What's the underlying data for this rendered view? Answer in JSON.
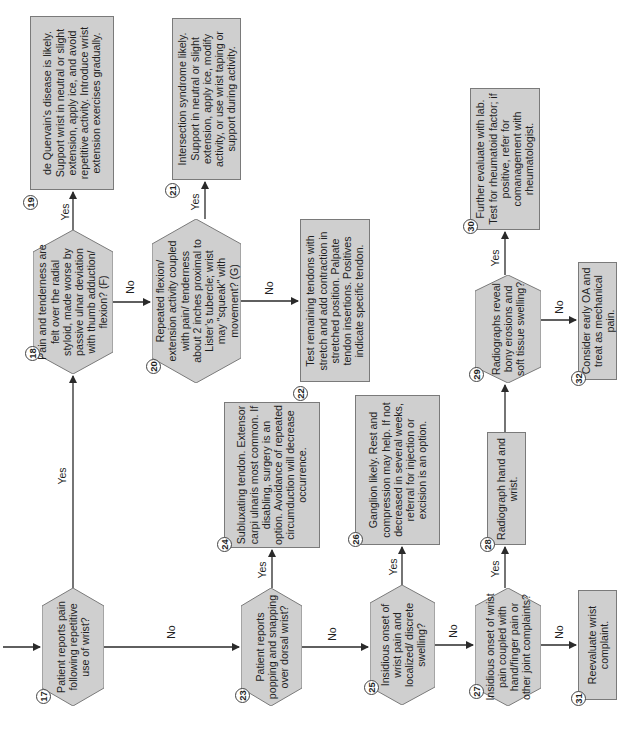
{
  "colors": {
    "fill": "#cfcfcf",
    "stroke": "#7a7a7a",
    "line": "#2a2a2a",
    "background": "#ffffff"
  },
  "nodes": {
    "n17": {
      "number": "17",
      "type": "decision",
      "text": "Patient reports pain following repetitive use of wrist?"
    },
    "n18": {
      "number": "18",
      "type": "decision",
      "text": "Pain and tenderness are felt over the radial styloid, made worse by passive ulnar deviation with thumb adduction/ flexion? (F)"
    },
    "n19": {
      "number": "19",
      "type": "action",
      "text": "de Quervain's disease is likely. Support wrist in neutral or slight extension, apply ice, and avoid repetitive activity. Introduce wrist extension exercises gradually."
    },
    "n20": {
      "number": "20",
      "type": "decision",
      "text": "Repeated flexion/ extension activity coupled with pain/ tenderness about 2 inches proximal to Lister's tubercle; wrist may \"squeak\" with movement? (G)"
    },
    "n21": {
      "number": "21",
      "type": "action",
      "text": "Intersection syndrome likely. Support in neutral or slight extension, apply ice, modify activity, or use wrist taping or support during activity."
    },
    "n22": {
      "number": "22",
      "type": "action",
      "text": "Test remaining tendons with stretch and add contraction in stretched position. Palpate tendon insertions. Positives indicate specific tendon."
    },
    "n23": {
      "number": "23",
      "type": "decision",
      "text": "Patient reports popping and snapping over dorsal wrist?"
    },
    "n24": {
      "number": "24",
      "type": "action",
      "text": "Subluxating tendon. Extensor carpi ulnaris most common. If disabling, surgery is an option. Avoidance of repeated circumduction will decrease occurrence."
    },
    "n25": {
      "number": "25",
      "type": "decision",
      "text": "Insidious onset of wrist pain and localized/ discrete swelling?"
    },
    "n26": {
      "number": "26",
      "type": "action",
      "text": "Ganglion likely. Rest and compression may help. If not decreased in several weeks, referral for injection or excision is an option."
    },
    "n27": {
      "number": "27",
      "type": "decision",
      "text": "Insidious onset of wrist pain coupled with hand/finger pain or other joint complaints?"
    },
    "n28": {
      "number": "28",
      "type": "action",
      "text": "Radiograph hand and wrist."
    },
    "n29": {
      "number": "29",
      "type": "decision",
      "text": "Radiographs reveal bony erosions and soft tissue swelling?"
    },
    "n30": {
      "number": "30",
      "type": "action",
      "text": "Further evaluate with lab. Test for rheumatoid factor; if positive, refer for comanagement with rheumatologist."
    },
    "n31": {
      "number": "31",
      "type": "action",
      "text": "Reevaluate wrist complaint."
    },
    "n32": {
      "number": "32",
      "type": "action",
      "text": "Consider early OA and treat as mechanical pain."
    }
  },
  "edges": [
    {
      "from": "entry",
      "to": "17",
      "label": ""
    },
    {
      "from": "17",
      "to": "18",
      "label": "Yes"
    },
    {
      "from": "17",
      "to": "23",
      "label": "No"
    },
    {
      "from": "18",
      "to": "19",
      "label": "Yes"
    },
    {
      "from": "18",
      "to": "20",
      "label": "No"
    },
    {
      "from": "20",
      "to": "21",
      "label": "Yes"
    },
    {
      "from": "20",
      "to": "22",
      "label": "No"
    },
    {
      "from": "23",
      "to": "24",
      "label": "Yes"
    },
    {
      "from": "23",
      "to": "25",
      "label": "No"
    },
    {
      "from": "25",
      "to": "26",
      "label": "Yes"
    },
    {
      "from": "25",
      "to": "27",
      "label": "No"
    },
    {
      "from": "27",
      "to": "28",
      "label": "Yes"
    },
    {
      "from": "27",
      "to": "31",
      "label": "No"
    },
    {
      "from": "28",
      "to": "29",
      "label": ""
    },
    {
      "from": "29",
      "to": "30",
      "label": "Yes"
    },
    {
      "from": "29",
      "to": "32",
      "label": "No"
    }
  ],
  "labels": {
    "yes": "Yes",
    "no": "No"
  }
}
